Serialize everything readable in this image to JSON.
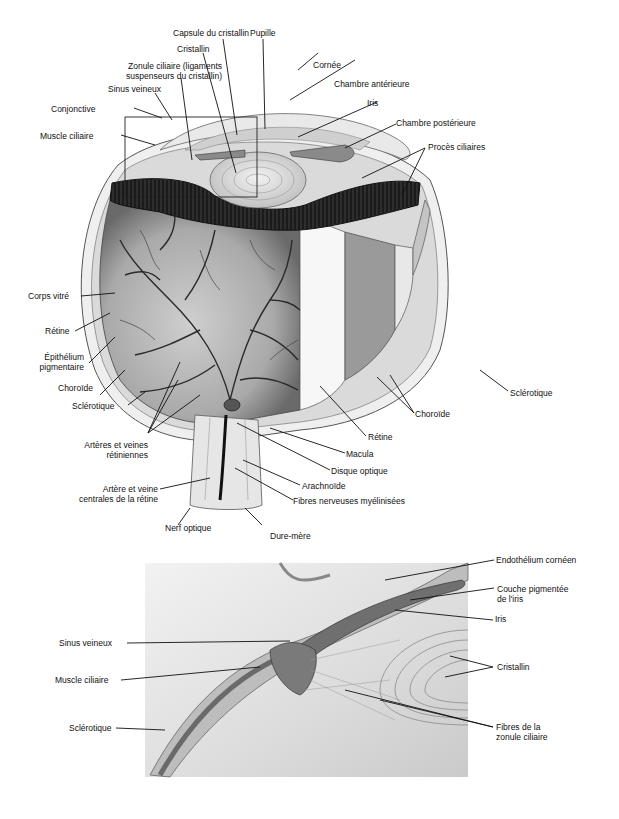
{
  "page": {
    "number": ""
  },
  "figure_top": {
    "title": "Globe oculaire (coupe)",
    "labels": {
      "capsule_cristallin": "Capsule du cristallin",
      "pupille": "Pupille",
      "cristallin": "Cristallin",
      "cornee": "Cornée",
      "zonule_line1": "Zonule ciliaire (ligaments",
      "zonule_line2": "suspenseurs du cristallin)",
      "chambre_anterieure": "Chambre antérieure",
      "sinus_veineux": "Sinus veineux",
      "iris": "Iris",
      "conjonctive": "Conjonctive",
      "chambre_posterieure": "Chambre postérieure",
      "muscle_ciliaire": "Muscle ciliaire",
      "proces_ciliaires": "Procès ciliaires",
      "corps_vitre": "Corps vitré",
      "retine_left": "Rétine",
      "epithelium_line1": "Épithélium",
      "epithelium_line2": "pigmentaire",
      "choroide_left": "Choroïde",
      "sclerotique_left": "Sclérotique",
      "sclerotique_right": "Sclérotique",
      "choroide_right": "Choroïde",
      "retine_right": "Rétine",
      "macula": "Macula",
      "arteres_line1": "Artères et veines",
      "arteres_line2": "rétiniennes",
      "disque_optique": "Disque optique",
      "arachnoide": "Arachnoïde",
      "artere_centrale_line1": "Artère et veine",
      "artere_centrale_line2": "centrales de la rétine",
      "fibres_myelinisees": "Fibres nerveuses myélinisées",
      "nerf_optique": "Nerf optique",
      "dure_mere": "Dure-mère"
    }
  },
  "figure_bottom": {
    "title": "Agrandissement de l'angle irido-cornéen",
    "labels": {
      "endothelium": "Endothélium cornéen",
      "couche_line1": "Couche pigmentée",
      "couche_line2": "de l'iris",
      "iris": "Iris",
      "sinus_veineux": "Sinus veineux",
      "cristallin": "Cristallin",
      "muscle_ciliaire": "Muscle ciliaire",
      "fibres_line1": "Fibres de la",
      "fibres_line2": "zonule ciliaire",
      "sclerotique": "Sclérotique"
    }
  },
  "colors": {
    "ink": "#111111",
    "tissue_dark": "#1a1a1a",
    "tissue_mid": "#8a8a8a",
    "tissue_light": "#d8d8d8",
    "paper": "#ffffff"
  }
}
